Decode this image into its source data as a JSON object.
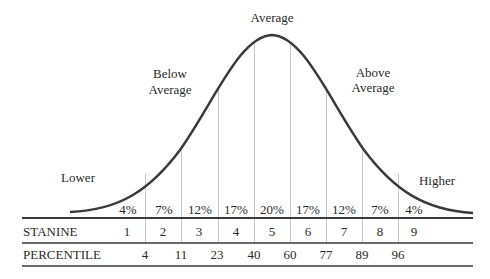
{
  "labels": {
    "average": "Average",
    "below_average_1": "Below",
    "below_average_2": "Average",
    "above_average_1": "Above",
    "above_average_2": "Average",
    "lower": "Lower",
    "higher": "Higher"
  },
  "percentages": [
    "4%",
    "7%",
    "12%",
    "17%",
    "20%",
    "17%",
    "12%",
    "7%",
    "4%"
  ],
  "table": {
    "stanine_label": "STANINE",
    "stanines": [
      "1",
      "2",
      "3",
      "4",
      "5",
      "6",
      "7",
      "8",
      "9"
    ],
    "percentile_label": "PERCENTILE",
    "percentiles": [
      "4",
      "11",
      "23",
      "40",
      "60",
      "77",
      "89",
      "96"
    ]
  },
  "colors": {
    "curve": "#3a3a3a",
    "divider": "#c8c8c8",
    "rule": "#3a3a3a",
    "text": "#2a2a2a"
  }
}
